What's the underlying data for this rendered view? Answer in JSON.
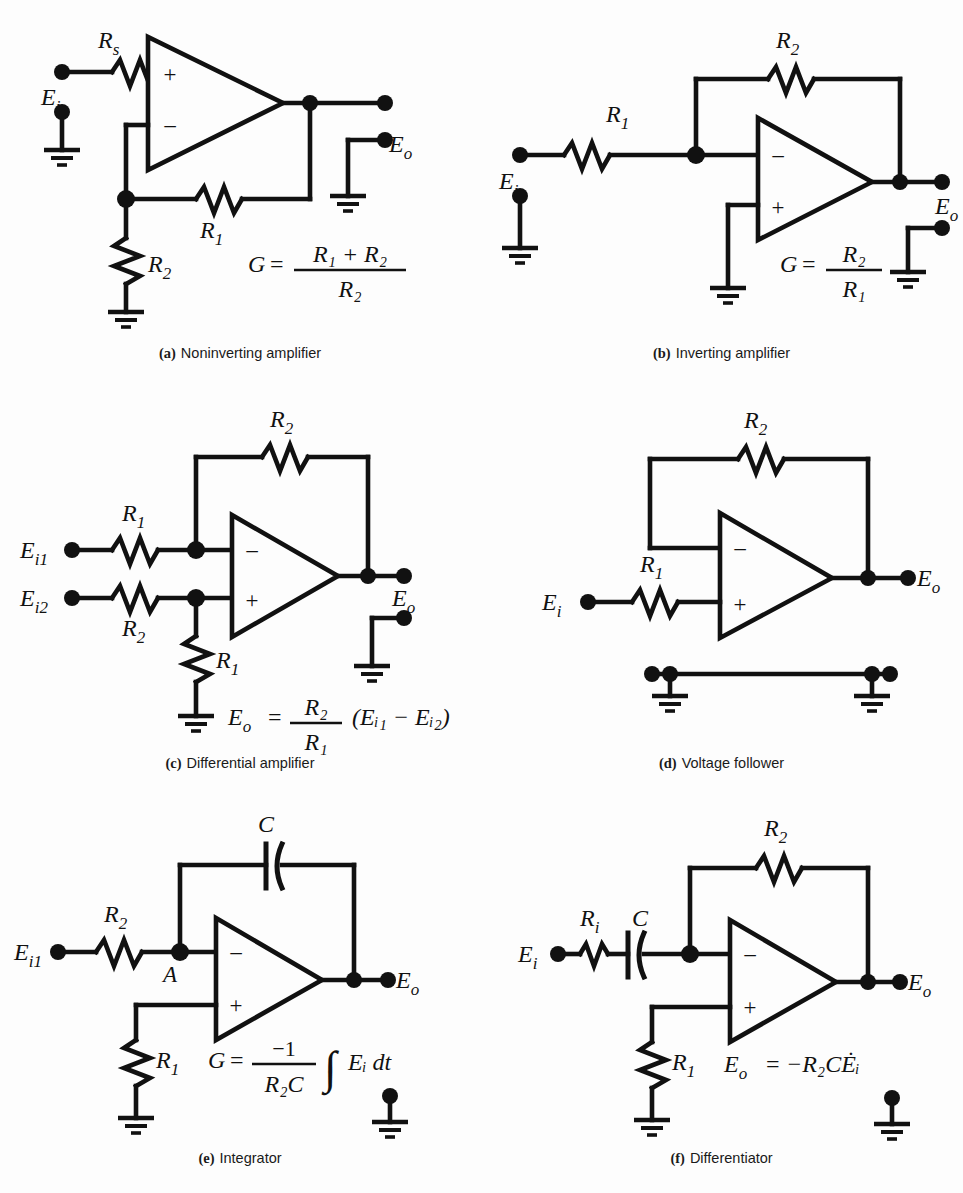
{
  "figure": {
    "background": "#fdfdfd",
    "ink": "#111111",
    "type": "operational-amplifier-circuit-collection",
    "panel_count": 6
  },
  "panels": [
    {
      "id": "a",
      "tag": "(a)",
      "title": "Noninverting amplifier",
      "caption_tag": "(a)",
      "caption_text": "Noninverting amplifier",
      "labels": {
        "input": "E",
        "input_sub": "i",
        "output": "E",
        "output_sub": "o",
        "series_r": "R",
        "series_r_sub": "s",
        "feedback_r": "R",
        "feedback_r_sub": "1",
        "shunt_r": "R",
        "shunt_r_sub": "2",
        "plus": "+",
        "minus": "−",
        "node_label": ""
      },
      "formula": {
        "lhs": "G",
        "eq": "=",
        "numerator": "R₁ + R₂",
        "denominator": "R₂",
        "plain": "G = (R1 + R2) / R2"
      },
      "components": [
        "Rs",
        "R1",
        "R2",
        "opamp",
        "ground",
        "ground",
        "ground"
      ]
    },
    {
      "id": "b",
      "tag": "(b)",
      "title": "Inverting amplifier",
      "caption_tag": "(b)",
      "caption_text": "Inverting amplifier",
      "labels": {
        "input": "E",
        "input_sub": "i",
        "output": "E",
        "output_sub": "o",
        "series_r": "R",
        "series_r_sub": "1",
        "feedback_r": "R",
        "feedback_r_sub": "2",
        "plus": "+",
        "minus": "−"
      },
      "formula": {
        "lhs": "G",
        "eq": "=",
        "numerator": "R₂",
        "denominator": "R₁",
        "plain": "G = R2 / R1"
      },
      "components": [
        "R1",
        "R2",
        "opamp",
        "ground",
        "ground",
        "ground"
      ]
    },
    {
      "id": "c",
      "tag": "(c)",
      "title": "Differential amplifier",
      "caption_tag": "(c)",
      "caption_text": "Differential amplifier",
      "labels": {
        "input1": "E",
        "input1_sub": "i1",
        "input2": "E",
        "input2_sub": "i2",
        "output": "E",
        "output_sub": "o",
        "top_series_r": "R",
        "top_series_r_sub": "1",
        "bottom_series_r": "R",
        "bottom_series_r_sub": "2",
        "feedback_r": "R",
        "feedback_r_sub": "2",
        "shunt_r": "R",
        "shunt_r_sub": "1",
        "plus": "+",
        "minus": "−"
      },
      "formula": {
        "lhs": "E",
        "lhs_sub": "o",
        "eq": "=",
        "numerator": "R₂",
        "denominator": "R₁",
        "tail": "(Eᵢ₁ − Eᵢ₂)",
        "plain": "Eo = (R2/R1)(Ei1 - Ei2)"
      },
      "components": [
        "R1",
        "R2",
        "R2-feedback",
        "R1-shunt",
        "opamp",
        "ground",
        "ground"
      ]
    },
    {
      "id": "d",
      "tag": "(d)",
      "title": "Voltage follower",
      "caption_tag": "(d)",
      "caption_text": "Voltage follower",
      "labels": {
        "input": "E",
        "input_sub": "i",
        "output": "E",
        "output_sub": "o",
        "series_r": "R",
        "series_r_sub": "1",
        "feedback_r": "R",
        "feedback_r_sub": "2",
        "plus": "+",
        "minus": "−"
      },
      "formula": null,
      "components": [
        "R1",
        "R2",
        "opamp",
        "ground-bus",
        "ground",
        "ground"
      ]
    },
    {
      "id": "e",
      "tag": "(e)",
      "title": "Integrator",
      "caption_tag": "(e)",
      "caption_text": "Integrator",
      "labels": {
        "input": "E",
        "input_sub": "i1",
        "output": "E",
        "output_sub": "o",
        "series_r": "R",
        "series_r_sub": "2",
        "shunt_r": "R",
        "shunt_r_sub": "1",
        "cap": "C",
        "node": "A",
        "plus": "+",
        "minus": "−"
      },
      "formula": {
        "lhs": "G",
        "eq": "=",
        "numerator": "−1",
        "denominator": "R₂C",
        "integral": "∫",
        "tail": "Eᵢ dt",
        "plain": "G = (-1 / R2C) ∫ Ei dt"
      },
      "components": [
        "R2",
        "R1",
        "C",
        "opamp",
        "ground",
        "ground"
      ]
    },
    {
      "id": "f",
      "tag": "(f)",
      "title": "Differentiator",
      "caption_tag": "(f)",
      "caption_text": "Differentiator",
      "labels": {
        "input": "E",
        "input_sub": "i",
        "output": "E",
        "output_sub": "o",
        "series_r": "R",
        "series_r_sub": "i",
        "cap": "C",
        "feedback_r": "R",
        "feedback_r_sub": "2",
        "shunt_r": "R",
        "shunt_r_sub": "1",
        "plus": "+",
        "minus": "−"
      },
      "formula": {
        "lhs": "E",
        "lhs_sub": "o",
        "eq": "=",
        "rhs": "−R₂CĖᵢ",
        "plain": "Eo = -R2 C Edot_i"
      },
      "components": [
        "Ri",
        "C",
        "R2",
        "R1",
        "opamp",
        "ground",
        "ground"
      ]
    }
  ]
}
